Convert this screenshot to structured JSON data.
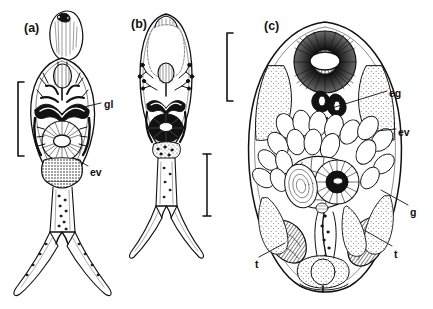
{
  "figure": {
    "kind": "scientific-line-drawing",
    "background_color": "#ffffff",
    "ink_color": "#111111",
    "stipple_color": "#6d6d6d",
    "panel_count": 3
  },
  "panels": [
    {
      "id": "a",
      "letter": "(a)",
      "letter_x": 24,
      "letter_y": 22,
      "description": "furcocercous cercaria, whole body with forked tail",
      "scale_bar": {
        "style": "bracket",
        "x": 18,
        "y_top": 82,
        "y_bottom": 156
      }
    },
    {
      "id": "b",
      "letter": "(b)",
      "letter_x": 131,
      "letter_y": 18,
      "description": "cercaria body, oval, flame cells and excretory system",
      "scale_bar": {
        "style": "capped-line",
        "x": 207,
        "y_top": 154,
        "y_bottom": 216
      }
    },
    {
      "id": "c",
      "letter": "(c)",
      "letter_x": 264,
      "letter_y": 20,
      "description": "adult worm, ventral view with oral sucker, gut, testes and vitellaria",
      "scale_bar": {
        "style": "bracket",
        "x": 227,
        "y_top": 33,
        "y_bottom": 101
      }
    }
  ],
  "annotations": [
    {
      "key": "gl",
      "text": "gl",
      "panel": "a",
      "x": 104,
      "y": 99,
      "leader": {
        "x1": 101,
        "y1": 103,
        "x2": 84,
        "y2": 107
      }
    },
    {
      "key": "ev",
      "text": "ev",
      "panel": "a",
      "x": 90,
      "y": 167,
      "leader": {
        "x1": 88,
        "y1": 166,
        "x2": 74,
        "y2": 158
      }
    },
    {
      "key": "eg",
      "text": "eg",
      "panel": "c",
      "x": 389,
      "y": 88,
      "leader": {
        "x1": 387,
        "y1": 91,
        "x2": 332,
        "y2": 108
      }
    },
    {
      "key": "ev",
      "text": "ev",
      "panel": "c",
      "x": 398,
      "y": 127,
      "leader": {
        "x1": 396,
        "y1": 129,
        "x2": 377,
        "y2": 131
      }
    },
    {
      "key": "g",
      "text": "g",
      "panel": "c",
      "x": 410,
      "y": 207,
      "leader": {
        "x1": 408,
        "y1": 205,
        "x2": 381,
        "y2": 190
      }
    },
    {
      "key": "t-right",
      "text": "t",
      "panel": "c",
      "x": 394,
      "y": 249,
      "leader": {
        "x1": 392,
        "y1": 246,
        "x2": 364,
        "y2": 230
      }
    },
    {
      "key": "t-left",
      "text": "t",
      "panel": "c",
      "x": 255,
      "y": 259,
      "leader": {
        "x1": 259,
        "y1": 257,
        "x2": 285,
        "y2": 243
      }
    }
  ],
  "legend_keys": {
    "gl": "gland",
    "ev": "excretory vesicle",
    "eg": "egg",
    "g": "gut",
    "t": "testis"
  }
}
